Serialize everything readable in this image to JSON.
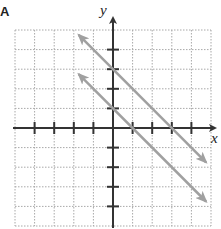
{
  "figure": {
    "corner_label": "A",
    "x_axis_label": "x",
    "y_axis_label": "y"
  },
  "colors": {
    "grid": "#a8a8a8",
    "axis": "#333333",
    "line": "#a0a0a0",
    "background": "#ffffff"
  },
  "chart_data": {
    "type": "line",
    "title": "",
    "xlabel": "x",
    "ylabel": "y",
    "xlim": [
      -5,
      5
    ],
    "ylim": [
      -5,
      5
    ],
    "grid": true,
    "grid_style": "dotted",
    "ticks": {
      "x": [
        -4,
        -3,
        -2,
        -1,
        1,
        2,
        3,
        4
      ],
      "y": [
        -4,
        -3,
        -2,
        -1,
        1,
        2,
        3,
        4
      ]
    },
    "tick_labels_shown": false,
    "legend": null,
    "series": [
      {
        "name": "y = -x + 3",
        "slope": -1,
        "intercept": 3,
        "x": [
          -1.75,
          4.75
        ],
        "y": [
          4.75,
          -1.75
        ],
        "arrows": "both"
      },
      {
        "name": "y = -x + 1",
        "slope": -1,
        "intercept": 1,
        "x": [
          -1.75,
          4.75
        ],
        "y": [
          2.75,
          -3.75
        ],
        "arrows": "both"
      }
    ]
  }
}
